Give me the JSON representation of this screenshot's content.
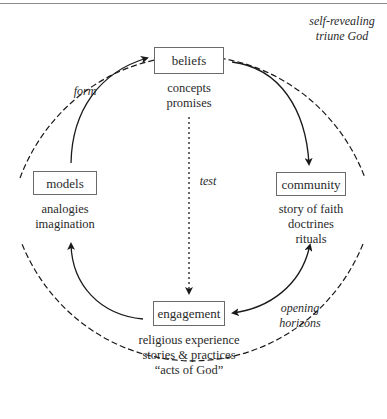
{
  "diagram": {
    "type": "cycle-diagram",
    "nodes": {
      "beliefs": {
        "label": "beliefs",
        "details": [
          "concepts",
          "promises"
        ]
      },
      "community": {
        "label": "community",
        "details": [
          "story of faith",
          "doctrines",
          "rituals"
        ]
      },
      "engagement": {
        "label": "engagement",
        "details": [
          "religious experience",
          "stories & practices",
          "“acts of God”"
        ]
      },
      "models": {
        "label": "models",
        "details": [
          "analogies",
          "imagination"
        ]
      }
    },
    "edges": [
      {
        "from": "models",
        "to": "beliefs",
        "label": "form",
        "style": "solid"
      },
      {
        "from": "beliefs",
        "to": "community",
        "label": "",
        "style": "solid"
      },
      {
        "from": "community",
        "to": "engagement",
        "label": "opening horizons",
        "style": "solid",
        "bidirectional": true
      },
      {
        "from": "engagement",
        "to": "models",
        "label": "",
        "style": "solid"
      },
      {
        "from": "beliefs",
        "to": "engagement",
        "label": "test",
        "style": "dotted"
      }
    ],
    "labels": {
      "enclosure_line1": "self-revealing",
      "enclosure_line2": "triune God",
      "form": "form",
      "test": "test",
      "opening_line1": "opening",
      "opening_line2": "horizons"
    },
    "colors": {
      "stroke": "#1a1a1a",
      "box_border": "#6a6a6a",
      "text": "#2a2a2a",
      "rule": "#8a8a8a"
    }
  }
}
